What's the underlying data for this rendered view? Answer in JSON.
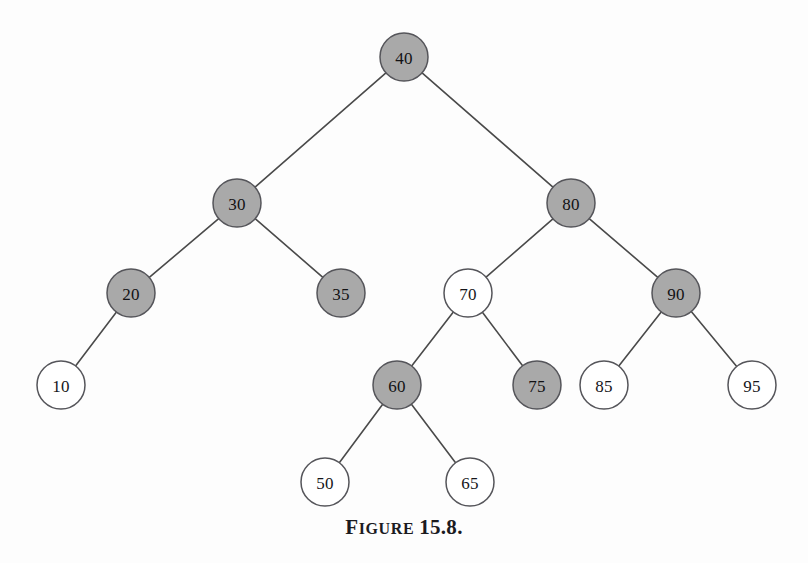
{
  "figure": {
    "caption_label": "FIGURE",
    "caption_label_first": "F",
    "caption_label_rest": "IGURE",
    "caption_number": "15.8.",
    "caption_full": "FIGURE 15.8."
  },
  "colors": {
    "background": "#fdfdfd",
    "node_filled": "#a9a9a9",
    "node_empty": "#ffffff",
    "node_stroke": "#55555a",
    "edge_stroke": "#4a4a4a",
    "label_text": "#16161a",
    "caption_text": "#1b1b1f"
  },
  "chart_data": {
    "type": "diagram",
    "diagram_kind": "binary-search-tree",
    "node_radius": 24,
    "fill_legend": {
      "filled": "shaded / gray node",
      "empty": "unshaded / white node"
    },
    "nodes": [
      {
        "id": "n40",
        "label": "40",
        "value": 40,
        "x": 404,
        "y": 57,
        "fill": "filled",
        "level": 0
      },
      {
        "id": "n30",
        "label": "30",
        "value": 30,
        "x": 237,
        "y": 203,
        "fill": "filled",
        "level": 1
      },
      {
        "id": "n80",
        "label": "80",
        "value": 80,
        "x": 571,
        "y": 203,
        "fill": "filled",
        "level": 1
      },
      {
        "id": "n20",
        "label": "20",
        "value": 20,
        "x": 131,
        "y": 293,
        "fill": "filled",
        "level": 2
      },
      {
        "id": "n35",
        "label": "35",
        "value": 35,
        "x": 341,
        "y": 293,
        "fill": "filled",
        "level": 2
      },
      {
        "id": "n70",
        "label": "70",
        "value": 70,
        "x": 468,
        "y": 293,
        "fill": "empty",
        "level": 2
      },
      {
        "id": "n90",
        "label": "90",
        "value": 90,
        "x": 676,
        "y": 293,
        "fill": "filled",
        "level": 2
      },
      {
        "id": "n10",
        "label": "10",
        "value": 10,
        "x": 61,
        "y": 385,
        "fill": "empty",
        "level": 3
      },
      {
        "id": "n60",
        "label": "60",
        "value": 60,
        "x": 397,
        "y": 385,
        "fill": "filled",
        "level": 3
      },
      {
        "id": "n75",
        "label": "75",
        "value": 75,
        "x": 537,
        "y": 385,
        "fill": "filled",
        "level": 3
      },
      {
        "id": "n85",
        "label": "85",
        "value": 85,
        "x": 604,
        "y": 385,
        "fill": "empty",
        "level": 3
      },
      {
        "id": "n95",
        "label": "95",
        "value": 95,
        "x": 752,
        "y": 385,
        "fill": "empty",
        "level": 3
      },
      {
        "id": "n50",
        "label": "50",
        "value": 50,
        "x": 325,
        "y": 482,
        "fill": "empty",
        "level": 4
      },
      {
        "id": "n65",
        "label": "65",
        "value": 65,
        "x": 470,
        "y": 482,
        "fill": "empty",
        "level": 4
      }
    ],
    "edges": [
      {
        "from": "n40",
        "to": "n30",
        "side": "left"
      },
      {
        "from": "n40",
        "to": "n80",
        "side": "right"
      },
      {
        "from": "n30",
        "to": "n20",
        "side": "left"
      },
      {
        "from": "n30",
        "to": "n35",
        "side": "right"
      },
      {
        "from": "n80",
        "to": "n70",
        "side": "left"
      },
      {
        "from": "n80",
        "to": "n90",
        "side": "right"
      },
      {
        "from": "n20",
        "to": "n10",
        "side": "left"
      },
      {
        "from": "n70",
        "to": "n60",
        "side": "left"
      },
      {
        "from": "n70",
        "to": "n75",
        "side": "right"
      },
      {
        "from": "n90",
        "to": "n85",
        "side": "left"
      },
      {
        "from": "n90",
        "to": "n95",
        "side": "right"
      },
      {
        "from": "n60",
        "to": "n50",
        "side": "left"
      },
      {
        "from": "n60",
        "to": "n65",
        "side": "right"
      }
    ]
  }
}
